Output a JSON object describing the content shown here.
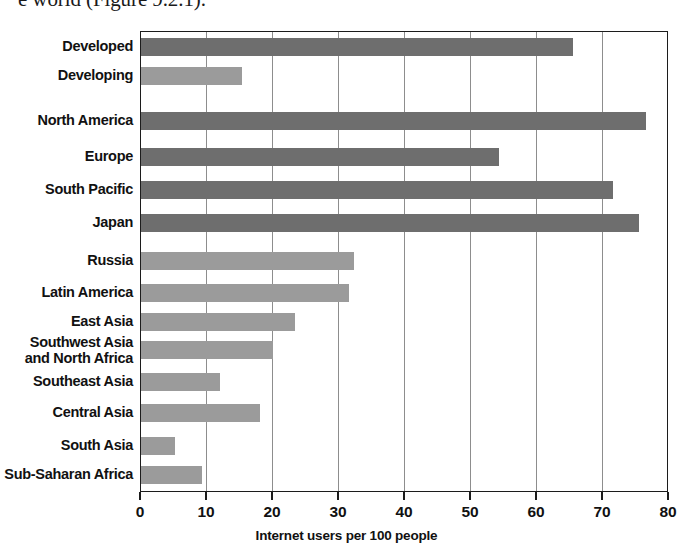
{
  "page_text_fragment": "e world (Figure 9.2.1).",
  "chart_data": {
    "type": "bar",
    "orientation": "horizontal",
    "title": "",
    "xlabel": "Internet users per 100 people",
    "ylabel": "",
    "xlim": [
      0,
      80
    ],
    "xticks": [
      0,
      10,
      20,
      30,
      40,
      50,
      60,
      70,
      80
    ],
    "xtick_labels": [
      "0",
      "10",
      "20",
      "30",
      "40",
      "50",
      "60",
      "70",
      "80"
    ],
    "grid": "vertical",
    "legend": "none",
    "colors": {
      "developed_bar": "#6e6e6e",
      "developing_bar": "#9b9b9b",
      "frame": "#1c1c1c",
      "gridline": "#8d8d8d",
      "text": "#111111",
      "background": "#ffffff"
    },
    "categories": [
      "Developed",
      "Developing",
      "North America",
      "Europe",
      "South Pacific",
      "Japan",
      "Russia",
      "Latin America",
      "East Asia",
      "Southwest Asia and North Africa",
      "Southeast Asia",
      "Central Asia",
      "South Asia",
      "Sub-Saharan Africa"
    ],
    "values": [
      65.5,
      15.3,
      76.5,
      54.2,
      71.5,
      75.5,
      32.3,
      31.5,
      23.3,
      20.0,
      12.0,
      18.0,
      5.1,
      9.2
    ],
    "bars": [
      {
        "label": "Developed",
        "label_lines": "Developed",
        "value": 65.5,
        "shade": "dark",
        "color": "#6e6e6e",
        "group": 1
      },
      {
        "label": "Developing",
        "label_lines": "Developing",
        "value": 15.3,
        "shade": "light",
        "color": "#9b9b9b",
        "group": 1
      },
      {
        "label": "North America",
        "label_lines": "North America",
        "value": 76.5,
        "shade": "dark",
        "color": "#6e6e6e",
        "group": 2
      },
      {
        "label": "Europe",
        "label_lines": "Europe",
        "value": 54.2,
        "shade": "dark",
        "color": "#6e6e6e",
        "group": 2
      },
      {
        "label": "South Pacific",
        "label_lines": "South Pacific",
        "value": 71.5,
        "shade": "dark",
        "color": "#6e6e6e",
        "group": 2
      },
      {
        "label": "Japan",
        "label_lines": "Japan",
        "value": 75.5,
        "shade": "dark",
        "color": "#6e6e6e",
        "group": 2
      },
      {
        "label": "Russia",
        "label_lines": "Russia",
        "value": 32.3,
        "shade": "light",
        "color": "#9b9b9b",
        "group": 3
      },
      {
        "label": "Latin America",
        "label_lines": "Latin America",
        "value": 31.5,
        "shade": "light",
        "color": "#9b9b9b",
        "group": 3
      },
      {
        "label": "East Asia",
        "label_lines": "East Asia",
        "value": 23.3,
        "shade": "light",
        "color": "#9b9b9b",
        "group": 3
      },
      {
        "label": "Southwest Asia and North Africa",
        "label_lines": "Southwest Asia\nand North Africa",
        "value": 20.0,
        "shade": "light",
        "color": "#9b9b9b",
        "group": 3
      },
      {
        "label": "Southeast Asia",
        "label_lines": "Southeast Asia",
        "value": 12.0,
        "shade": "light",
        "color": "#9b9b9b",
        "group": 3
      },
      {
        "label": "Central Asia",
        "label_lines": "Central Asia",
        "value": 18.0,
        "shade": "light",
        "color": "#9b9b9b",
        "group": 3
      },
      {
        "label": "South Asia",
        "label_lines": "South Asia",
        "value": 5.1,
        "shade": "light",
        "color": "#9b9b9b",
        "group": 3
      },
      {
        "label": "Sub-Saharan Africa",
        "label_lines": "Sub-Saharan Africa",
        "value": 9.2,
        "shade": "light",
        "color": "#9b9b9b",
        "group": 3
      }
    ]
  }
}
